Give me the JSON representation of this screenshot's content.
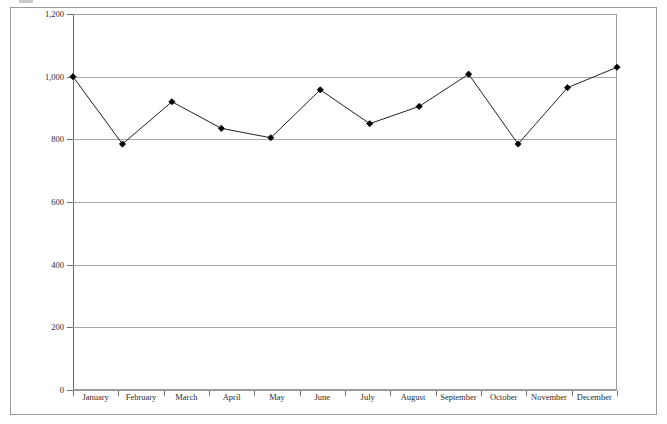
{
  "figure": {
    "frame_color": "#9a9a9a",
    "grid_color": "#a8a8a8",
    "series_color": "#000000",
    "caption_remnant": ""
  },
  "chart_data": {
    "type": "line",
    "title": "",
    "xlabel": "",
    "ylabel": "",
    "categories": [
      "January",
      "February",
      "March",
      "April",
      "May",
      "June",
      "July",
      "August",
      "September",
      "October",
      "November",
      "December"
    ],
    "values": [
      1000,
      785,
      920,
      835,
      805,
      958,
      850,
      905,
      1008,
      785,
      965,
      1030
    ],
    "ylim": [
      0,
      1200
    ],
    "yticks": [
      0,
      200,
      400,
      600,
      800,
      1000,
      1200
    ],
    "ytick_labels": [
      "0",
      "200",
      "400",
      "600",
      "800",
      "1,000",
      "1,200"
    ],
    "grid": "horizontal",
    "legend": "none",
    "marker": "filled-diamond",
    "series": [
      {
        "name": "",
        "values": [
          1000,
          785,
          920,
          835,
          805,
          958,
          850,
          905,
          1008,
          785,
          965,
          1030
        ]
      }
    ]
  }
}
